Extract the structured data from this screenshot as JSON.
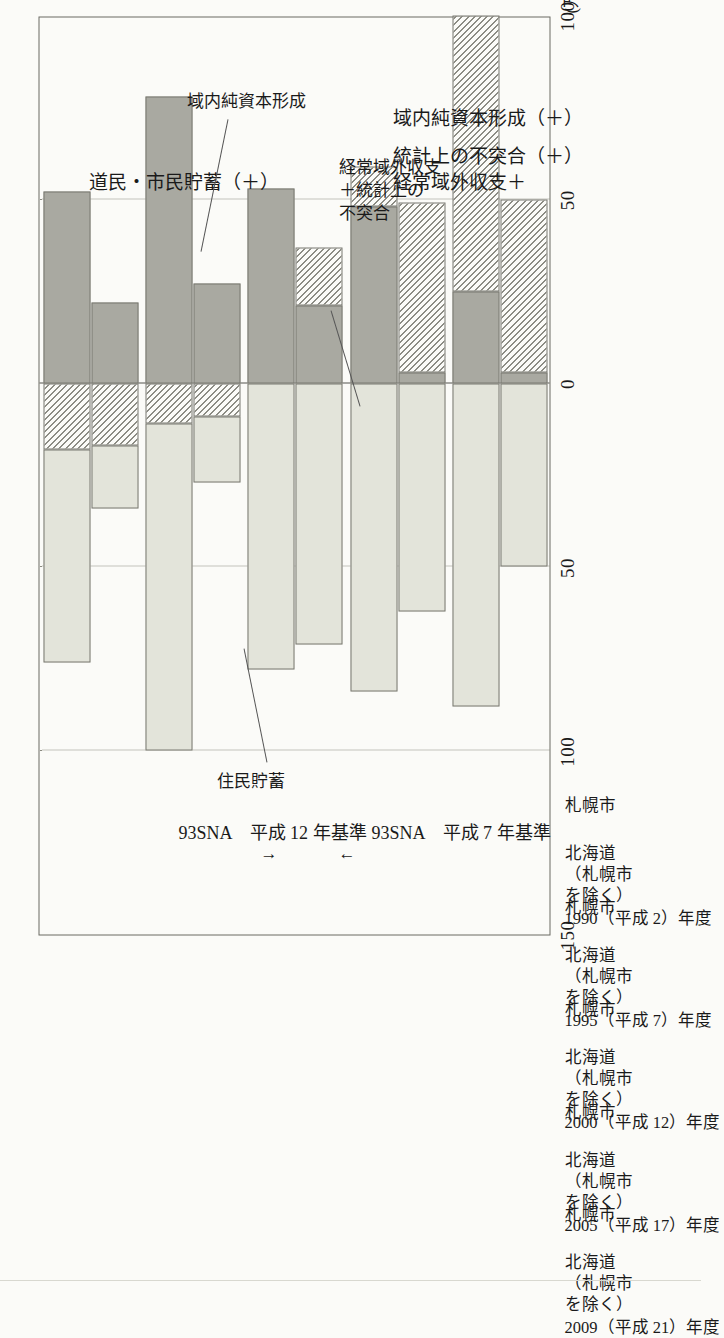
{
  "figure": {
    "unit_label": "(万円)",
    "axis_titles": {
      "upper": "道民・市民貯蓄（＋）",
      "lower_1": "経常域外収支＋",
      "lower_2": "統計上の不突合（＋）",
      "lower_3": "域内純資本形成（＋）"
    },
    "basis_left": "93SNA　平成 7 年基準",
    "basis_right": "93SNA　平成 12 年基準",
    "arrow_left": "←",
    "arrow_right": "→",
    "annotations": [
      {
        "id": "juumin-chochiku",
        "text": "住民貯蓄"
      },
      {
        "id": "keijou-iki-gai",
        "text": "経常域外収支\n＋統計上の\n不突合"
      },
      {
        "id": "ikinai-junshihon",
        "text": "域内純資本形成"
      }
    ],
    "annotation_lines": [
      "経常域外収支",
      "＋統計上の",
      "不突合"
    ]
  },
  "chart_data": {
    "type": "bar",
    "title": "",
    "subtitle": "",
    "orientation": "vertical-stacked-diverging",
    "xlabel": "",
    "ylabel": "(万円)",
    "ylim": [
      -100,
      150
    ],
    "yticks": [
      150,
      100,
      50,
      0,
      50,
      100
    ],
    "ytick_labels": [
      "150",
      "100",
      "50",
      "0",
      "50",
      "100"
    ],
    "grid": true,
    "legend": "none",
    "series_names": [
      "住民貯蓄",
      "経常域外収支＋統計上の不突合",
      "域内純資本形成"
    ],
    "series_colors": {
      "住民貯蓄": "#e3e4da",
      "経常域外収支＋統計上の不突合": "#a9a9a1",
      "域内純資本形成": "hatched"
    },
    "period_labels": [
      "1990（平成 2）年度",
      "1995（平成 7）年度",
      "2000（平成 12）年度",
      "2005（平成 17）年度",
      "2009（平成 21）年度"
    ],
    "region_labels": [
      "北海道（札幌市を除く）",
      "札幌市"
    ],
    "region_label_lines": [
      [
        "北海道",
        "（札幌市",
        "を除く）"
      ],
      [
        "札幌市"
      ]
    ],
    "groups": [
      {
        "period": "1990（平成 2）年度",
        "bars": [
          {
            "region": "北海道（札幌市を除く）",
            "savings": 88,
            "current_balance": -25,
            "net_capital_formation": -75,
            "segments": [
              {
                "name": "住民貯蓄",
                "from": 0,
                "to": 88,
                "style": "light"
              },
              {
                "name": "経常域外収支＋統計上の不突合",
                "from": 0,
                "to": -25,
                "style": "dark"
              },
              {
                "name": "域内純資本形成",
                "from": -25,
                "to": -100,
                "style": "hatch"
              }
            ]
          },
          {
            "region": "札幌市",
            "savings": 50,
            "current_balance": -3,
            "net_capital_formation": -47,
            "segments": [
              {
                "name": "住民貯蓄",
                "from": 0,
                "to": 50,
                "style": "light"
              },
              {
                "name": "経常域外収支＋統計上の不突合",
                "from": 0,
                "to": -3,
                "style": "dark"
              },
              {
                "name": "域内純資本形成",
                "from": -3,
                "to": -50,
                "style": "hatch"
              }
            ]
          }
        ]
      },
      {
        "period": "1995（平成 7）年度",
        "bars": [
          {
            "region": "北海道（札幌市を除く）",
            "savings": 84,
            "current_balance": -48,
            "net_capital_formation": -11,
            "segments": [
              {
                "name": "住民貯蓄",
                "from": 0,
                "to": 84,
                "style": "light"
              },
              {
                "name": "経常域外収支＋統計上の不突合",
                "from": 0,
                "to": -48,
                "style": "dark"
              },
              {
                "name": "域内純資本形成",
                "from": -48,
                "to": -59,
                "style": "hatch"
              }
            ]
          },
          {
            "region": "札幌市",
            "savings": 62,
            "current_balance": -3,
            "net_capital_formation": -46,
            "segments": [
              {
                "name": "住民貯蓄",
                "from": 0,
                "to": 62,
                "style": "light"
              },
              {
                "name": "経常域外収支＋統計上の不突合",
                "from": 0,
                "to": -3,
                "style": "dark"
              },
              {
                "name": "域内純資本形成",
                "from": -3,
                "to": -49,
                "style": "hatch"
              }
            ]
          }
        ]
      },
      {
        "period": "2000（平成 12）年度",
        "bars": [
          {
            "region": "北海道（札幌市を除く）",
            "savings": 78,
            "current_balance": -53,
            "net_capital_formation": 0,
            "segments": [
              {
                "name": "住民貯蓄",
                "from": 0,
                "to": 78,
                "style": "light"
              },
              {
                "name": "経常域外収支＋統計上の不突合",
                "from": 0,
                "to": -53,
                "style": "dark"
              }
            ]
          },
          {
            "region": "札幌市",
            "savings": 71,
            "current_balance": -21,
            "net_capital_formation": -16,
            "segments": [
              {
                "name": "住民貯蓄",
                "from": 0,
                "to": 71,
                "style": "light"
              },
              {
                "name": "経常域外収支＋統計上の不突合",
                "from": 0,
                "to": -21,
                "style": "dark"
              },
              {
                "name": "域内純資本形成",
                "from": -21,
                "to": -37,
                "style": "hatch"
              }
            ]
          }
        ]
      },
      {
        "period": "2005（平成 17）年度",
        "bars": [
          {
            "region": "北海道（札幌市を除く）",
            "savings": 89,
            "current_balance": -78,
            "net_capital_formation": 11,
            "segments": [
              {
                "name": "住民貯蓄",
                "from": 11,
                "to": 100,
                "style": "light"
              },
              {
                "name": "域内純資本形成",
                "from": 0,
                "to": 11,
                "style": "hatch"
              },
              {
                "name": "経常域外収支＋統計上の不突合",
                "from": 0,
                "to": -78,
                "style": "dark"
              }
            ]
          },
          {
            "region": "札幌市",
            "savings": 18,
            "current_balance": -27,
            "net_capital_formation": 9,
            "segments": [
              {
                "name": "住民貯蓄",
                "from": 9,
                "to": 27,
                "style": "light"
              },
              {
                "name": "域内純資本形成",
                "from": 0,
                "to": 9,
                "style": "hatch"
              },
              {
                "name": "経常域外収支＋統計上の不突合",
                "from": 0,
                "to": -27,
                "style": "dark"
              }
            ]
          }
        ]
      },
      {
        "period": "2009（平成 21）年度",
        "bars": [
          {
            "region": "北海道（札幌市を除く）",
            "savings": 58,
            "current_balance": -52,
            "net_capital_formation": 18,
            "segments": [
              {
                "name": "住民貯蓄",
                "from": 18,
                "to": 76,
                "style": "light"
              },
              {
                "name": "域内純資本形成",
                "from": 0,
                "to": 18,
                "style": "hatch"
              },
              {
                "name": "経常域外収支＋統計上の不突合",
                "from": 0,
                "to": -52,
                "style": "dark"
              }
            ]
          },
          {
            "region": "札幌市",
            "savings": 17,
            "current_balance": -22,
            "net_capital_formation": 17,
            "segments": [
              {
                "name": "住民貯蓄",
                "from": 17,
                "to": 34,
                "style": "light"
              },
              {
                "name": "域内純資本形成",
                "from": 0,
                "to": 17,
                "style": "hatch"
              },
              {
                "name": "経常域外収支＋統計上の不突合",
                "from": 0,
                "to": -22,
                "style": "dark"
              }
            ]
          }
        ]
      }
    ]
  }
}
